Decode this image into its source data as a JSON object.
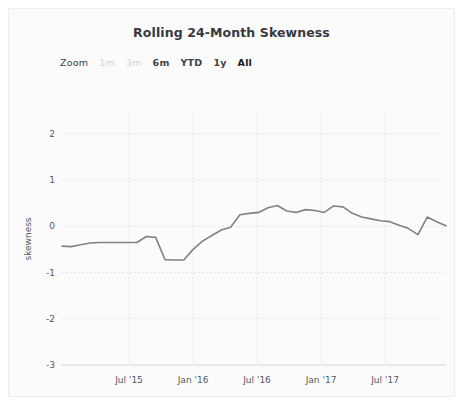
{
  "card": {
    "background": "#fbfbfc",
    "border_color": "#ececee"
  },
  "header": {
    "title": "Rolling 24-Month Skewness"
  },
  "range_selector": {
    "label": "Zoom",
    "buttons": [
      {
        "label": "1m",
        "state": "disabled"
      },
      {
        "label": "3m",
        "state": "disabled"
      },
      {
        "label": "6m",
        "state": "enabled"
      },
      {
        "label": "YTD",
        "state": "enabled"
      },
      {
        "label": "1y",
        "state": "enabled"
      },
      {
        "label": "All",
        "state": "selected"
      }
    ]
  },
  "chart_data": {
    "type": "line",
    "title": "Rolling 24-Month Skewness",
    "xlabel": "",
    "ylabel": "skewness",
    "ylim": [
      -3,
      2.45
    ],
    "yticks": [
      2,
      1,
      0,
      -1,
      -2,
      -3
    ],
    "ytick_labels": [
      "2",
      "1",
      "0",
      "-1",
      "-2",
      "-3"
    ],
    "xticks": [
      "Jul '15",
      "Jan '16",
      "Jul '16",
      "Jan '17",
      "Jul '17"
    ],
    "xtick_positions": [
      0.1746,
      0.3413,
      0.5079,
      0.6746,
      0.8413
    ],
    "grid": true,
    "grid_color": "#e2e4e7",
    "grid_style": "dashed",
    "line_color": "#7f8286",
    "line_width": 1.6,
    "legend": "none",
    "x": [
      "2014-09",
      "2014-10",
      "2014-11",
      "2014-12",
      "2015-01",
      "2015-02",
      "2015-03",
      "2015-04",
      "2015-05",
      "2015-06",
      "2015-07",
      "2015-08",
      "2015-09",
      "2015-10",
      "2015-11",
      "2015-12",
      "2016-01",
      "2016-02",
      "2016-03",
      "2016-04",
      "2016-05",
      "2016-06",
      "2016-07",
      "2016-08",
      "2016-09",
      "2016-10",
      "2016-11",
      "2016-12",
      "2017-01",
      "2017-02",
      "2017-03",
      "2017-04",
      "2017-05",
      "2017-06",
      "2017-07",
      "2017-08",
      "2017-09",
      "2017-10",
      "2017-11",
      "2017-12",
      "2018-01",
      "2018-02"
    ],
    "values": [
      -0.43,
      -0.44,
      -0.4,
      -0.36,
      -0.35,
      -0.35,
      -0.35,
      -0.35,
      -0.35,
      -0.22,
      -0.24,
      -0.72,
      -0.73,
      -0.73,
      -0.5,
      -0.32,
      -0.2,
      -0.08,
      -0.02,
      0.25,
      0.28,
      0.3,
      0.4,
      0.45,
      0.33,
      0.3,
      0.36,
      0.34,
      0.3,
      0.44,
      0.42,
      0.28,
      0.2,
      0.16,
      0.12,
      0.1,
      0.02,
      -0.05,
      -0.18,
      0.2,
      0.1,
      0.01
    ],
    "series": [
      {
        "name": "skewness",
        "color": "#7f8286"
      }
    ]
  }
}
